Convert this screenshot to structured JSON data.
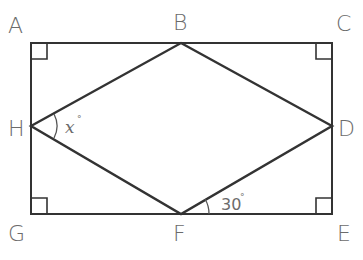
{
  "diagram": {
    "type": "geometry",
    "colors": {
      "stroke": "#333333",
      "label": "#6b6b6b",
      "background": "#ffffff"
    },
    "points": {
      "A": {
        "label": "A"
      },
      "B": {
        "label": "B"
      },
      "C": {
        "label": "C"
      },
      "D": {
        "label": "D"
      },
      "E": {
        "label": "E"
      },
      "F": {
        "label": "F"
      },
      "G": {
        "label": "G"
      },
      "H": {
        "label": "H"
      }
    },
    "right_angles": [
      "A",
      "C",
      "E",
      "G"
    ],
    "angles": {
      "H": {
        "label": "x",
        "unit": "°"
      },
      "F": {
        "label": "30",
        "unit": "°",
        "between": "DF and FE"
      }
    }
  }
}
